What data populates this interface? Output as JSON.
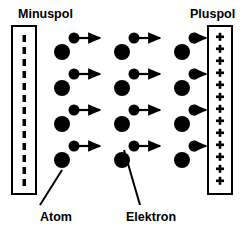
{
  "diagram": {
    "title_visible": false,
    "colors": {
      "ink": "#000000",
      "background": "#ffffff"
    },
    "labels": {
      "minus_pole": "Minuspol",
      "plus_pole": "Pluspol",
      "atom": "Atom",
      "electron": "Elektron"
    },
    "cathode": {
      "name": "minus-pole-electrode",
      "charge_symbol": "–",
      "symbol_count": 13,
      "style": "dashed-vertical-line",
      "x": 12,
      "y": 26,
      "width": 24,
      "height": 168
    },
    "anode": {
      "name": "plus-pole-electrode",
      "charge_symbol": "+",
      "symbol_count": 13,
      "x": 208,
      "y": 26,
      "width": 24,
      "height": 168
    },
    "lattice": {
      "rows": 4,
      "columns": 3,
      "row_y": [
        52,
        88,
        124,
        160
      ],
      "column_x": [
        62,
        122,
        182
      ],
      "atom_radius": 8,
      "electron_radius": 5.5,
      "electron_offset_x": 12,
      "electron_offset_y": -14,
      "arrow_length": 26,
      "arrow_direction": "right"
    },
    "callouts": [
      {
        "name": "atom-callout",
        "label": "Atom",
        "label_x": 62,
        "label_y": 216,
        "line_from": [
          38,
          208
        ],
        "line_to": [
          62,
          171
        ]
      },
      {
        "name": "electron-callout",
        "label": "Elektron",
        "label_x": 155,
        "label_y": 216,
        "line_from": [
          138,
          208
        ],
        "line_to": [
          122,
          148
        ]
      }
    ]
  }
}
